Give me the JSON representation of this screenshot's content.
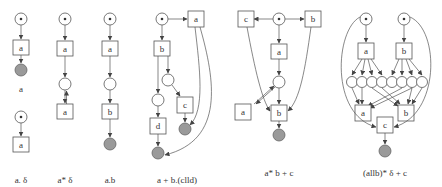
{
  "diagram": {
    "type": "petri-net-gallery",
    "nets": [
      {
        "id": "a",
        "caption": "a",
        "transitions": [
          "a"
        ],
        "has_final": true
      },
      {
        "id": "a-delta",
        "caption": "a. δ",
        "transitions": [
          "a"
        ],
        "has_final": false
      },
      {
        "id": "a-star-delta",
        "caption": "a* δ",
        "transitions": [
          "a",
          "a"
        ],
        "has_final": false
      },
      {
        "id": "a-dot-b",
        "caption": "a.b",
        "transitions": [
          "a",
          "b"
        ],
        "has_final": true
      },
      {
        "id": "a-plus-b-c-par-d",
        "caption": "a + b.(clld)",
        "transitions": [
          "a",
          "b",
          "c",
          "d"
        ],
        "has_final": true
      },
      {
        "id": "a-star-b-plus-c",
        "caption": "a* b + c",
        "transitions": [
          "c",
          "b",
          "a",
          "a",
          "b"
        ],
        "has_final": true
      },
      {
        "id": "a-par-b-star-delta-plus-c",
        "caption": "(allb)* δ + c",
        "transitions": [
          "a",
          "b",
          "a",
          "b",
          "c"
        ],
        "has_final": true
      }
    ]
  },
  "labels": {
    "t_a": "a",
    "t_b": "b",
    "t_c": "c",
    "t_d": "d"
  },
  "captions": {
    "net1": "a",
    "net2": "a. δ",
    "net3": "a* δ",
    "net4": "a.b",
    "net5": "a + b.(clld)",
    "net6": "a* b + c",
    "net7": "(allb)* δ + c"
  }
}
